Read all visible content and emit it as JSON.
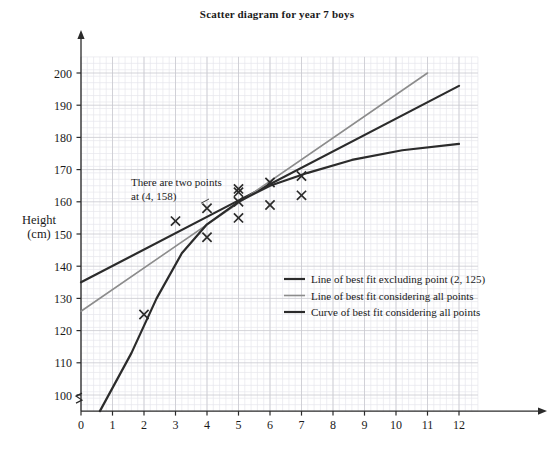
{
  "chart_data": {
    "type": "scatter",
    "title": "Scatter diagram for year 7 boys",
    "xlabel": "",
    "ylabel": "Height\n(cm)",
    "ylabel_line1": "Height",
    "ylabel_line2": "(cm)",
    "xlim": [
      0,
      12.6
    ],
    "ylim": [
      95,
      205
    ],
    "xticks": [
      0,
      1,
      2,
      3,
      4,
      5,
      6,
      7,
      8,
      9,
      10,
      11,
      12
    ],
    "yticks": [
      100,
      110,
      120,
      130,
      140,
      150,
      160,
      170,
      180,
      190,
      200
    ],
    "grid": true,
    "grid_minor_divisions": 5,
    "axis_break_y": true,
    "marker": "x",
    "points": [
      {
        "x": 2,
        "y": 125
      },
      {
        "x": 3,
        "y": 154
      },
      {
        "x": 4,
        "y": 158
      },
      {
        "x": 4,
        "y": 149
      },
      {
        "x": 5,
        "y": 164
      },
      {
        "x": 5,
        "y": 163
      },
      {
        "x": 5,
        "y": 160
      },
      {
        "x": 5,
        "y": 155
      },
      {
        "x": 6,
        "y": 166
      },
      {
        "x": 6,
        "y": 159
      },
      {
        "x": 7,
        "y": 168
      },
      {
        "x": 7,
        "y": 162
      }
    ],
    "series": [
      {
        "name": "Line of best fit excluding point (2, 125)",
        "type": "line",
        "color": "#2b2b2b",
        "width": 2.2,
        "points": [
          [
            0,
            135
          ],
          [
            12,
            196
          ]
        ]
      },
      {
        "name": "Line of best fit considering all points",
        "type": "line",
        "color": "#8c8c8c",
        "width": 1.6,
        "points": [
          [
            0,
            126
          ],
          [
            11,
            200
          ]
        ]
      },
      {
        "name": "Curve of best fit considering all points",
        "type": "curve",
        "color": "#2b2b2b",
        "width": 2.2,
        "points": [
          [
            0.6,
            95
          ],
          [
            1.6,
            113
          ],
          [
            2.4,
            130
          ],
          [
            3.2,
            144
          ],
          [
            4.0,
            153
          ],
          [
            5.0,
            160
          ],
          [
            6.0,
            165
          ],
          [
            7.2,
            169
          ],
          [
            8.6,
            173
          ],
          [
            10.2,
            176
          ],
          [
            12.0,
            178
          ]
        ]
      }
    ],
    "annotation": {
      "line1": "There are two points",
      "line2": "at (4, 158)",
      "target": [
        4,
        158
      ]
    },
    "legend": {
      "position": "inside-right",
      "entries": [
        {
          "label": "Line of best fit excluding point (2, 125)",
          "color": "#2b2b2b",
          "width": 2.2
        },
        {
          "label": "Line of best fit considering all points",
          "color": "#8c8c8c",
          "width": 1.6
        },
        {
          "label": "Curve of best fit considering all points",
          "color": "#2b2b2b",
          "width": 2.2
        }
      ]
    },
    "colors": {
      "grid_major": "#c9c9cf",
      "grid_minor": "#e6e6ec",
      "axis": "#2b2b2b",
      "marker": "#2b2b2b",
      "background": "#ffffff"
    }
  }
}
